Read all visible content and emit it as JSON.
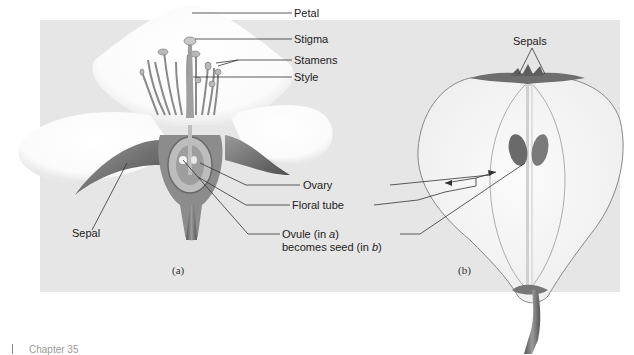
{
  "figure": {
    "panel_a": {
      "caption": "(a)",
      "labels": {
        "petal": "Petal",
        "stigma": "Stigma",
        "stamens": "Stamens",
        "style": "Style",
        "sepal": "Sepal"
      }
    },
    "shared_labels": {
      "ovary": "Ovary",
      "floral_tube": "Floral tube",
      "ovule_line1_prefix": "Ovule (in ",
      "ovule_line1_italic": "a",
      "ovule_line1_suffix": ")",
      "ovule_line2_prefix": "becomes seed (in ",
      "ovule_line2_italic": "b",
      "ovule_line2_suffix": ")"
    },
    "panel_b": {
      "caption": "(b)",
      "labels": {
        "sepals": "Sepals"
      }
    },
    "colors": {
      "panel_bg": "#e6e6e6",
      "petal": "#ffffff",
      "tissue": "#8a8a8a",
      "dark_tissue": "#5a5a5a",
      "line": "#333333"
    }
  },
  "footer": {
    "chapter_label": "Chapter 35"
  }
}
